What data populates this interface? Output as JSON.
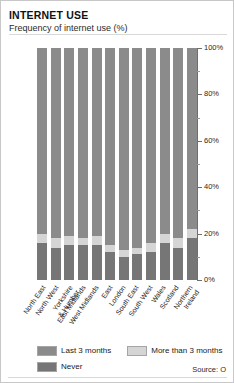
{
  "header": {
    "title": "INTERNET USE",
    "subtitle": "Frequency of internet use (%)"
  },
  "legend": {
    "items": [
      {
        "label": "Last 3 months",
        "color": "#8b8b8b",
        "key": "recent"
      },
      {
        "label": "More than 3 months",
        "color": "#d5d5d5",
        "key": "older"
      },
      {
        "label": "Never",
        "color": "#767676",
        "key": "never"
      }
    ]
  },
  "source": "Source: O",
  "chart_data": {
    "type": "bar",
    "title": "INTERNET USE",
    "subtitle": "Frequency of internet use (%)",
    "xlabel": "",
    "ylabel": "",
    "ylim": [
      0,
      100
    ],
    "stacked": true,
    "stack_total": 100,
    "grid": false,
    "axis_position": "right",
    "legend_position": "bottom",
    "ytick_labels": [
      "0%",
      "20%",
      "40%",
      "60%",
      "80%",
      "100%"
    ],
    "ytick_values": [
      0,
      20,
      40,
      60,
      80,
      100
    ],
    "yminor_values": [
      10,
      30,
      50,
      70,
      90
    ],
    "categories": [
      "North East",
      "North West",
      "Yorkshire\n& Humber",
      "East Midlands",
      "West Midlands",
      "East",
      "London",
      "South East",
      "South West",
      "Wales",
      "Scotland",
      "Northern\nIreland"
    ],
    "series": [
      {
        "name": "Last 3 months",
        "color": "#8b8b8b",
        "values": [
          80,
          82,
          81,
          82,
          81,
          85,
          87,
          86,
          84,
          80,
          82,
          78
        ]
      },
      {
        "name": "More than 3 months",
        "color": "#d5d5d5",
        "values": [
          4,
          4,
          4,
          3,
          4,
          3,
          3,
          3,
          4,
          4,
          4,
          4
        ]
      },
      {
        "name": "Never",
        "color": "#767676",
        "values": [
          16,
          14,
          15,
          15,
          15,
          12,
          10,
          11,
          12,
          16,
          14,
          18
        ]
      }
    ]
  }
}
